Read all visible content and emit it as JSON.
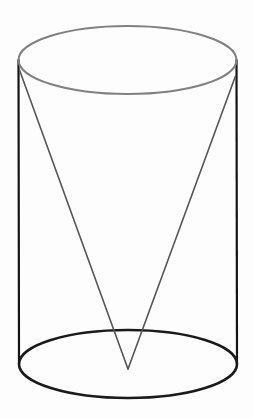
{
  "canvas": {
    "width": 253,
    "height": 418,
    "background_color": "#fdfdfd",
    "title": "Inverted cone inscribed in a cylinder"
  },
  "figure": {
    "name": "cone-inscribed-in-cylinder",
    "solids": [
      "cylinder",
      "cone"
    ],
    "style": {
      "stroke_top_ellipse": "#808080",
      "stroke_bottom_ellipse": "#1a1a1a",
      "stroke_vertical_sides": "#141414",
      "stroke_cone_slant": "#555555",
      "stroke_width_top_ellipse": 2.0,
      "stroke_width_bottom_ellipse": 2.6,
      "stroke_width_vertical_sides": 2.2,
      "stroke_width_cone_slant": 1.6,
      "fill": "none"
    },
    "geometry": {
      "top_ellipse": {
        "cx": 127.5,
        "cy": 60,
        "rx": 109,
        "ry": 34
      },
      "bottom_ellipse": {
        "cx": 128,
        "cy": 364,
        "rx": 109,
        "ry": 34
      },
      "left_side": {
        "x1": 18.5,
        "y1": 60,
        "x2": 19,
        "y2": 364
      },
      "right_side": {
        "x1": 236.5,
        "y1": 60,
        "x2": 237,
        "y2": 364
      },
      "cone_apex": {
        "x": 128,
        "y": 369
      },
      "cone_left_slant": {
        "x1": 19.5,
        "y1": 70,
        "x2": 128,
        "y2": 369
      },
      "cone_right_slant": {
        "x1": 235.5,
        "y1": 76,
        "x2": 128,
        "y2": 369
      }
    }
  },
  "labels": {
    "visible_text": []
  }
}
